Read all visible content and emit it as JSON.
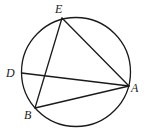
{
  "figure": {
    "type": "inscribed-geometry",
    "stroke_color": "#1a1a1a",
    "background": "#ffffff",
    "circle": {
      "cx": 76,
      "cy": 72,
      "r": 54.5
    },
    "points": [
      {
        "id": "E",
        "label": "E",
        "x": 62,
        "y": 18,
        "label_x": 55,
        "label_y": 13
      },
      {
        "id": "D",
        "label": "D",
        "x": 21.5,
        "y": 73,
        "label_x": 6,
        "label_y": 77
      },
      {
        "id": "A",
        "label": "A",
        "x": 129,
        "y": 86,
        "label_x": 131,
        "label_y": 92
      },
      {
        "id": "B",
        "label": "B",
        "x": 35,
        "y": 108,
        "label_x": 24,
        "label_y": 119
      }
    ],
    "segments": [
      {
        "id": "EA",
        "from": "E",
        "to": "A"
      },
      {
        "id": "EB",
        "from": "E",
        "to": "B"
      },
      {
        "id": "DA",
        "from": "D",
        "to": "A"
      },
      {
        "id": "BA",
        "from": "B",
        "to": "A"
      }
    ]
  }
}
